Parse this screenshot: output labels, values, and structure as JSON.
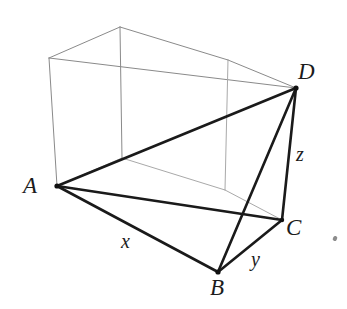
{
  "figure": {
    "canvas": {
      "width": 347,
      "height": 309,
      "background": "#ffffff"
    },
    "styles": {
      "box_stroke": "#8a8a8a",
      "box_stroke_hidden": "#a9a9a9",
      "box_width": 1.0,
      "solid_stroke": "#1a1a1a",
      "solid_width": 2.6,
      "vertex_dot": "#101010"
    },
    "vertices": [
      {
        "id": "A",
        "label": "A",
        "x": 57,
        "y": 186,
        "label_x": 23,
        "label_y": 174,
        "role": "front-bottom-left"
      },
      {
        "id": "B",
        "label": "B",
        "x": 218,
        "y": 272,
        "label_x": 210,
        "label_y": 276,
        "role": "front-bottom-near"
      },
      {
        "id": "C",
        "label": "C",
        "x": 282,
        "y": 220,
        "label_x": 286,
        "label_y": 216,
        "role": "front-bottom-right"
      },
      {
        "id": "D",
        "label": "D",
        "x": 296,
        "y": 88,
        "label_x": 298,
        "label_y": 60,
        "role": "front-top-right"
      }
    ],
    "box_corners": {
      "front_top_left": {
        "x": 49,
        "y": 58
      },
      "front_top_right": {
        "x": 296,
        "y": 88
      },
      "front_bottom_left": {
        "x": 57,
        "y": 186
      },
      "front_bottom_right": {
        "x": 282,
        "y": 220
      },
      "back_top_left": {
        "x": 120,
        "y": 27
      },
      "back_top_right": {
        "x": 228,
        "y": 60
      },
      "back_bottom_left": {
        "x": 122,
        "y": 158
      },
      "back_bottom_right": {
        "x": 225,
        "y": 190
      }
    },
    "box_edges": [
      {
        "name": "front-top",
        "from": "front_top_left",
        "to": "front_top_right",
        "hidden": false
      },
      {
        "name": "front-left",
        "from": "front_top_left",
        "to": "front_bottom_left",
        "hidden": false
      },
      {
        "name": "front-right",
        "from": "front_top_right",
        "to": "front_bottom_right",
        "hidden": false
      },
      {
        "name": "front-bottom",
        "from": "front_bottom_left",
        "to": "front_bottom_right",
        "hidden": true
      },
      {
        "name": "back-top",
        "from": "back_top_left",
        "to": "back_top_right",
        "hidden": false
      },
      {
        "name": "back-left",
        "from": "back_top_left",
        "to": "back_bottom_left",
        "hidden": false
      },
      {
        "name": "back-right",
        "from": "back_top_right",
        "to": "back_bottom_right",
        "hidden": true
      },
      {
        "name": "back-bottom",
        "from": "back_bottom_left",
        "to": "back_bottom_right",
        "hidden": true
      },
      {
        "name": "depth-top-left",
        "from": "front_top_left",
        "to": "back_top_left",
        "hidden": false
      },
      {
        "name": "depth-top-right",
        "from": "front_top_right",
        "to": "back_top_right",
        "hidden": false
      },
      {
        "name": "depth-bottom-left",
        "from": "front_bottom_left",
        "to": "back_bottom_left",
        "hidden": true
      },
      {
        "name": "depth-bottom-right",
        "from": "front_bottom_right",
        "to": "back_bottom_right",
        "hidden": true
      }
    ],
    "solid_edges": [
      {
        "name": "AB",
        "from": "A",
        "to": "B",
        "label": "x"
      },
      {
        "name": "BC",
        "from": "B",
        "to": "C",
        "label": "y"
      },
      {
        "name": "CD",
        "from": "C",
        "to": "D",
        "label": "z"
      },
      {
        "name": "AC",
        "from": "A",
        "to": "C",
        "label": ""
      },
      {
        "name": "AD",
        "from": "A",
        "to": "D",
        "label": ""
      },
      {
        "name": "BD",
        "from": "B",
        "to": "D",
        "label": ""
      }
    ],
    "edge_labels": [
      {
        "id": "x",
        "text": "x",
        "edge": "AB",
        "x": 121,
        "y": 231
      },
      {
        "id": "y",
        "text": "y",
        "edge": "BC",
        "x": 251,
        "y": 249
      },
      {
        "id": "z",
        "text": "z",
        "edge": "CD",
        "x": 296,
        "y": 144
      }
    ]
  }
}
